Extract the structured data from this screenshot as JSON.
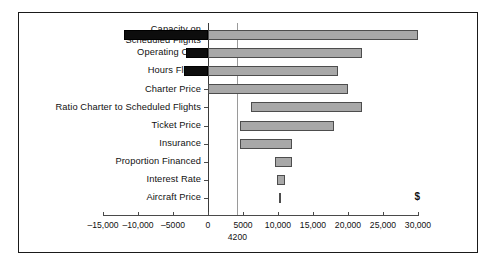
{
  "chart_data": {
    "type": "bar",
    "subtype": "tornado",
    "title": "",
    "xlabel": "",
    "ylabel": "",
    "unit_symbol": "$",
    "xlim": [
      -15000,
      30000
    ],
    "grid": false,
    "legend": "none",
    "orientation": "horizontal",
    "base_value": 4200,
    "base_value_label": "4200",
    "zero_label": "0",
    "categories": [
      "Capacity on\nScheduled Flights",
      "Operating Cost",
      "Hours Flown",
      "Charter Price",
      "Ratio Charter to Scheduled Flights",
      "Ticket Price",
      "Insurance",
      "Proportion Financed",
      "Interest Rate",
      "Aircraft Price"
    ],
    "bars": [
      {
        "category": "Capacity on Scheduled Flights",
        "low": -12000,
        "high": 30000
      },
      {
        "category": "Operating Cost",
        "low": -3200,
        "high": 22000
      },
      {
        "category": "Hours Flown",
        "low": -3500,
        "high": 18500
      },
      {
        "category": "Charter Price",
        "low": 0,
        "high": 20000
      },
      {
        "category": "Ratio Charter to Scheduled Flights",
        "low": 6200,
        "high": 22000
      },
      {
        "category": "Ticket Price",
        "low": 4500,
        "high": 18000
      },
      {
        "category": "Insurance",
        "low": 4500,
        "high": 12000
      },
      {
        "category": "Proportion Financed",
        "low": 9500,
        "high": 12000
      },
      {
        "category": "Interest Rate",
        "low": 9800,
        "high": 11000
      },
      {
        "category": "Aircraft Price",
        "low": 10100,
        "high": 10400
      }
    ],
    "xticks": [
      -15000,
      -10000,
      -5000,
      0,
      5000,
      10000,
      15000,
      20000,
      25000,
      30000
    ],
    "xtick_labels": [
      "–15,000",
      "–10,000",
      "–5000",
      "0",
      "5000",
      "10,000",
      "15,000",
      "20,000",
      "25,000",
      "30,000"
    ],
    "colors": {
      "positive_fill": "#a8a8a8",
      "positive_border": "#4d4d4d",
      "negative_fill": "#0d0d0d",
      "axis": "#4a4a4a",
      "reference_line": "#9a9a9a",
      "frame": "#1a1a1a",
      "text": "#111111"
    }
  }
}
